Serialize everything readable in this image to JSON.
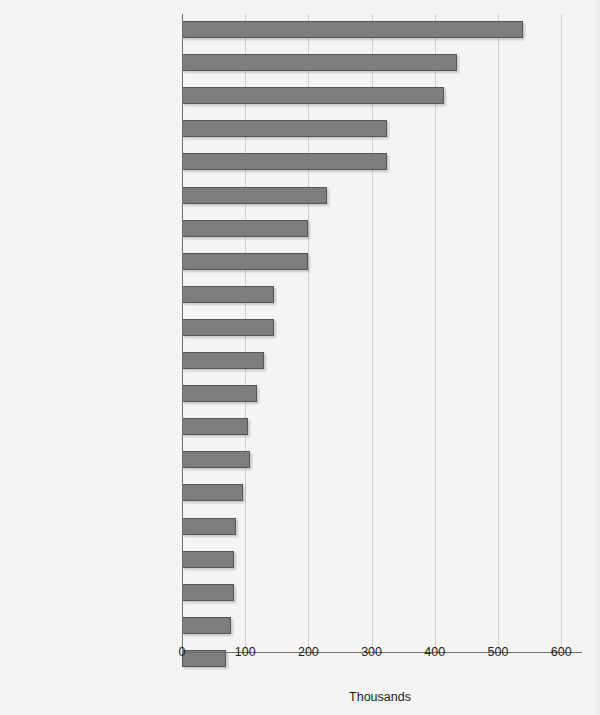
{
  "chart_data": {
    "type": "bar",
    "orientation": "horizontal",
    "title": "",
    "xlabel": "Thousands",
    "ylabel": "",
    "xlim": [
      0,
      630
    ],
    "xticks": [
      0,
      100,
      200,
      300,
      400,
      500,
      600
    ],
    "xtick_labels": [
      "0",
      "100",
      "200",
      "300",
      "400",
      "500",
      "600"
    ],
    "grid": "vertical",
    "legend": "none",
    "highlight_category": "Paralegals and legal assistants",
    "categories": [
      "Computer systems analysts",
      "Registered nurses",
      "Computer support specialists",
      "Computer engineers",
      "Teachers, secondary school",
      "Social workers",
      "College and university faculty",
      "Computer programmers",
      "Engineering, science, and\ncomputer systems managers",
      "Police patrol officers",
      "Teachers, special education",
      "Securities and financial\nservices sales agents",
      "Physicians",
      "Advertising, marketing, and\npublic relations managers",
      "Management analysts",
      "Electrical and electronics engineers",
      "Paralegals and legal assistants",
      "Writers and editors",
      "Artists and commercial artists",
      "Medical and health service managers"
    ],
    "values": [
      540,
      435,
      415,
      325,
      325,
      230,
      200,
      200,
      145,
      145,
      130,
      118,
      105,
      108,
      97,
      86,
      83,
      82,
      77,
      70
    ]
  },
  "bars": [
    {
      "label": "Computer systems analysts",
      "value": 540,
      "bold": false
    },
    {
      "label": "Registered nurses",
      "value": 435,
      "bold": false
    },
    {
      "label": "Computer support specialists",
      "value": 415,
      "bold": false
    },
    {
      "label": "Computer engineers",
      "value": 325,
      "bold": false
    },
    {
      "label": "Teachers, secondary school",
      "value": 325,
      "bold": false
    },
    {
      "label": "Social workers",
      "value": 230,
      "bold": false
    },
    {
      "label": "College and university faculty",
      "value": 200,
      "bold": false
    },
    {
      "label": "Computer programmers",
      "value": 200,
      "bold": false
    },
    {
      "label": "Engineering, science, and\ncomputer systems managers",
      "value": 145,
      "bold": false
    },
    {
      "label": "Police patrol officers",
      "value": 145,
      "bold": false
    },
    {
      "label": "Teachers, special education",
      "value": 130,
      "bold": false
    },
    {
      "label": "Securities and financial\nservices sales agents",
      "value": 118,
      "bold": false
    },
    {
      "label": "Physicians",
      "value": 105,
      "bold": false
    },
    {
      "label": "Advertising, marketing, and\npublic relations managers",
      "value": 108,
      "bold": false
    },
    {
      "label": "Management analysts",
      "value": 97,
      "bold": false
    },
    {
      "label": "Electrical and electronics engineers",
      "value": 86,
      "bold": false
    },
    {
      "label": "Paralegals and legal assistants",
      "value": 83,
      "bold": true
    },
    {
      "label": "Writers and editors",
      "value": 82,
      "bold": false
    },
    {
      "label": "Artists and commercial artists",
      "value": 77,
      "bold": false
    },
    {
      "label": "Medical and health service managers",
      "value": 70,
      "bold": false
    }
  ],
  "axis": {
    "xlabel": "Thousands",
    "ticks": [
      "0",
      "100",
      "200",
      "300",
      "400",
      "500",
      "600"
    ]
  },
  "colors": {
    "bar_fill": "#7d7d7d",
    "bar_border": "#555555",
    "gridline": "#cfcfcf",
    "axis": "#6e6e6e",
    "background": "#f4f4f2",
    "text": "#1b1b1b"
  },
  "clipped_header_text": ""
}
